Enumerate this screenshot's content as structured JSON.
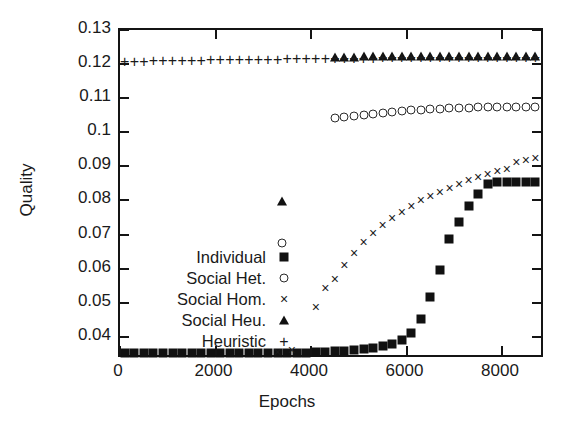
{
  "chart_data": {
    "type": "scatter",
    "title": "",
    "xlabel": "Epochs",
    "ylabel": "Quality",
    "xlim": [
      0,
      8900
    ],
    "ylim": [
      0.0335,
      0.13
    ],
    "grid": false,
    "legend_position": "center-left",
    "xticks": [
      0,
      2000,
      4000,
      6000,
      8000
    ],
    "xtick_labels": [
      "0",
      "2000",
      "4000",
      "6000",
      "8000"
    ],
    "yticks": [
      0.04,
      0.05,
      0.06,
      0.07,
      0.08,
      0.09,
      0.1,
      0.11,
      0.12,
      0.13
    ],
    "ytick_labels": [
      "0.04",
      "0.05",
      "0.06",
      "0.07",
      "0.08",
      "0.09",
      "0.1",
      "0.11",
      "0.12",
      "0.13"
    ],
    "series": [
      {
        "name": "Individual",
        "marker": "filled-square",
        "x": [
          100,
          300,
          500,
          700,
          900,
          1100,
          1300,
          1500,
          1700,
          1900,
          2100,
          2300,
          2500,
          2700,
          2900,
          3100,
          3300,
          3500,
          3700,
          3900,
          4100,
          4300,
          4500,
          4700,
          4900,
          5100,
          5300,
          5500,
          5700,
          5900,
          6100,
          6300,
          6500,
          6700,
          6900,
          7100,
          7300,
          7500,
          7700,
          7900,
          8100,
          8300,
          8500,
          8700
        ],
        "y": [
          0.0352,
          0.0352,
          0.0352,
          0.0352,
          0.0352,
          0.0352,
          0.0352,
          0.0352,
          0.0352,
          0.0352,
          0.0352,
          0.0352,
          0.0353,
          0.0353,
          0.0353,
          0.0353,
          0.0353,
          0.0354,
          0.0354,
          0.0354,
          0.0355,
          0.0356,
          0.0357,
          0.0358,
          0.036,
          0.0363,
          0.0367,
          0.0372,
          0.0379,
          0.0391,
          0.0411,
          0.0452,
          0.0516,
          0.0597,
          0.0688,
          0.0738,
          0.0783,
          0.0818,
          0.0847,
          0.0855,
          0.0855,
          0.0855,
          0.0855,
          0.0855
        ]
      },
      {
        "name": "Social Het.",
        "marker": "open-circle",
        "x": [
          3400,
          4500,
          4700,
          4900,
          5100,
          5300,
          5500,
          5700,
          5900,
          6100,
          6300,
          6500,
          6700,
          6900,
          7100,
          7300,
          7500,
          7700,
          7900,
          8100,
          8300,
          8500,
          8700
        ],
        "y": [
          0.0676,
          0.1042,
          0.1044,
          0.1047,
          0.1051,
          0.1054,
          0.1057,
          0.106,
          0.1062,
          0.1064,
          0.1066,
          0.1068,
          0.1069,
          0.107,
          0.1071,
          0.1072,
          0.1073,
          0.1074,
          0.1074,
          0.1075,
          0.1075,
          0.1075,
          0.1075
        ]
      },
      {
        "name": "Social Hom.",
        "marker": "cross",
        "x": [
          3300,
          3600,
          4100,
          4300,
          4500,
          4700,
          4900,
          5100,
          5300,
          5500,
          5700,
          5900,
          6100,
          6300,
          6500,
          6700,
          6900,
          7100,
          7300,
          7500,
          7700,
          7900,
          8100,
          8300,
          8500,
          8700
        ],
        "y": [
          0.0355,
          0.0361,
          0.0487,
          0.0543,
          0.0571,
          0.0612,
          0.0646,
          0.0679,
          0.0704,
          0.0727,
          0.0748,
          0.0766,
          0.0785,
          0.08,
          0.0813,
          0.0826,
          0.0838,
          0.0848,
          0.0861,
          0.0869,
          0.0878,
          0.0886,
          0.0891,
          0.0912,
          0.0918,
          0.0925
        ]
      },
      {
        "name": "Social Heu.",
        "marker": "filled-triangle",
        "x": [
          3400,
          4500,
          4700,
          4900,
          5100,
          5300,
          5500,
          5700,
          5900,
          6100,
          6300,
          6500,
          6700,
          6900,
          7100,
          7300,
          7500,
          7700,
          7900,
          8100,
          8300,
          8500,
          8700
        ],
        "y": [
          0.0799,
          0.1222,
          0.1222,
          0.1222,
          0.1223,
          0.1223,
          0.1223,
          0.1223,
          0.1224,
          0.1224,
          0.1224,
          0.1224,
          0.1224,
          0.1225,
          0.1225,
          0.1225,
          0.1225,
          0.1225,
          0.1225,
          0.1225,
          0.1225,
          0.1225,
          0.1225
        ]
      },
      {
        "name": "Heuristic",
        "marker": "plus",
        "x": [
          100,
          300,
          500,
          700,
          900,
          1100,
          1300,
          1500,
          1700,
          1900,
          2100,
          2300,
          2500,
          2700,
          2900,
          3100,
          3300,
          3500,
          3700,
          3900,
          4100,
          4300,
          4500,
          4700,
          4900,
          5100,
          5300,
          5500,
          5700,
          5900,
          6100,
          6300,
          6500,
          6700,
          6900,
          7100,
          7300,
          7500,
          7700,
          7900,
          8100,
          8300,
          8500,
          8700
        ],
        "y": [
          0.1208,
          0.1209,
          0.121,
          0.1211,
          0.1211,
          0.1212,
          0.1212,
          0.1213,
          0.1213,
          0.1214,
          0.1214,
          0.1215,
          0.1215,
          0.1215,
          0.1216,
          0.1216,
          0.1216,
          0.1217,
          0.1217,
          0.1217,
          0.1218,
          0.1218,
          0.1218,
          0.1219,
          0.1219,
          0.1219,
          0.1219,
          0.122,
          0.122,
          0.122,
          0.122,
          0.1221,
          0.1221,
          0.1221,
          0.1221,
          0.1221,
          0.1222,
          0.1222,
          0.1222,
          0.1222,
          0.1222,
          0.1222,
          0.1222,
          0.1222
        ]
      }
    ]
  },
  "legend": {
    "entries": [
      {
        "label": "Individual",
        "marker": "filled-square"
      },
      {
        "label": "Social Het.",
        "marker": "open-circle"
      },
      {
        "label": "Social Hom.",
        "marker": "cross"
      },
      {
        "label": "Social Heu.",
        "marker": "filled-triangle"
      },
      {
        "label": "Heuristic",
        "marker": "plus"
      }
    ]
  },
  "glyphs": {
    "cross": "×",
    "plus": "+"
  },
  "colors": {
    "axis": "#141414",
    "marker": "#111111",
    "text": "#1a1a1a",
    "background": "#ffffff"
  }
}
